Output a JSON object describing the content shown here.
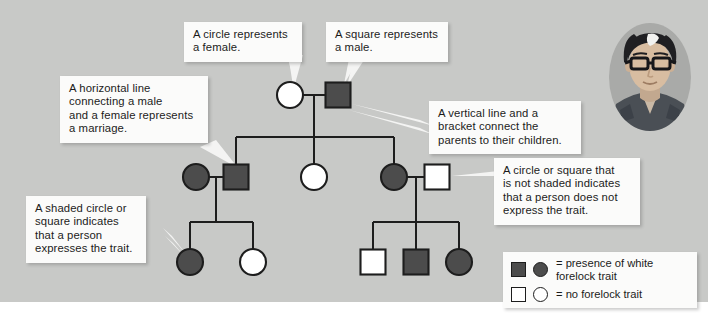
{
  "figure": {
    "type": "pedigree-chart",
    "topic": "white forelock trait inheritance"
  },
  "callouts": [
    {
      "id": "circle-female",
      "lines": [
        "A circle represents",
        "a female."
      ]
    },
    {
      "id": "square-male",
      "lines": [
        "A square represents",
        "a male."
      ]
    },
    {
      "id": "marriage-line",
      "lines": [
        "A horizontal line",
        "connecting a male",
        "and a female represents",
        "a marriage."
      ]
    },
    {
      "id": "vertical-bracket",
      "lines": [
        "A vertical line and a",
        "bracket connect the",
        "parents to their children."
      ]
    },
    {
      "id": "not-shaded",
      "lines": [
        "A circle or square that",
        "is not shaded indicates",
        "that a person does not",
        "express the trait."
      ]
    },
    {
      "id": "shaded",
      "lines": [
        "A shaded circle or",
        "square indicates",
        "that a person",
        "expresses the trait."
      ]
    }
  ],
  "legend": {
    "rows": [
      {
        "id": "affected",
        "square": "filled-square-icon",
        "circle": "filled-circle-icon",
        "lines": [
          "= presence of white",
          "forelock trait"
        ]
      },
      {
        "id": "unaffected",
        "square": "open-square-icon",
        "circle": "open-circle-icon",
        "lines": [
          "= no forelock trait"
        ]
      }
    ]
  },
  "pedigree": {
    "generations": [
      {
        "id": "generation-1",
        "individuals": [
          {
            "id": "g1-mother",
            "shape": "circle",
            "sex": "female",
            "affected": false,
            "cx": 290,
            "cy": 95
          },
          {
            "id": "g1-father",
            "shape": "square",
            "sex": "male",
            "affected": true,
            "cx": 338,
            "cy": 95
          }
        ]
      },
      {
        "id": "generation-2",
        "individuals": [
          {
            "id": "g2-spouse-left",
            "shape": "circle",
            "sex": "female",
            "affected": true,
            "cx": 196,
            "cy": 177
          },
          {
            "id": "g2-son",
            "shape": "square",
            "sex": "male",
            "affected": true,
            "cx": 236,
            "cy": 177
          },
          {
            "id": "g2-daughter-mid",
            "shape": "circle",
            "sex": "female",
            "affected": false,
            "cx": 314,
            "cy": 177
          },
          {
            "id": "g2-daughter-right",
            "shape": "circle",
            "sex": "female",
            "affected": true,
            "cx": 394,
            "cy": 177
          },
          {
            "id": "g2-spouse-right",
            "shape": "square",
            "sex": "male",
            "affected": false,
            "cx": 437,
            "cy": 177
          }
        ]
      },
      {
        "id": "generation-3",
        "individuals": [
          {
            "id": "g3-child-1",
            "shape": "circle",
            "sex": "female",
            "affected": true,
            "cx": 190,
            "cy": 262
          },
          {
            "id": "g3-child-2",
            "shape": "circle",
            "sex": "female",
            "affected": false,
            "cx": 253,
            "cy": 262
          },
          {
            "id": "g3-child-3",
            "shape": "square",
            "sex": "male",
            "affected": false,
            "cx": 373,
            "cy": 262
          },
          {
            "id": "g3-child-4",
            "shape": "square",
            "sex": "male",
            "affected": true,
            "cx": 416,
            "cy": 262
          },
          {
            "id": "g3-child-5",
            "shape": "circle",
            "sex": "female",
            "affected": true,
            "cx": 459,
            "cy": 262
          }
        ]
      }
    ]
  },
  "portrait": {
    "id": "person-photo",
    "description": "man with white forelock wearing glasses"
  },
  "colors": {
    "background": "#c8c9c7",
    "strip": "#ffffff",
    "callout_bg": "#fbfbfa",
    "affected_fill": "#4c4c4c",
    "unaffected_fill": "#ffffff",
    "stroke": "#1d1d1d",
    "text": "#1b1b1b"
  }
}
